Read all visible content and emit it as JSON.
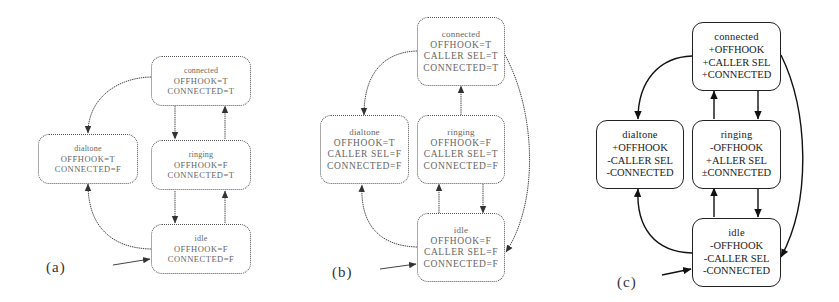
{
  "figure": {
    "panels": [
      {
        "label": "(a)",
        "style": "dotted",
        "states": {
          "connected": {
            "name": "connected",
            "vars": [
              "OFFHOOK=T",
              "CONNECTED=T"
            ]
          },
          "dialtone": {
            "name": "dialtone",
            "vars": [
              "OFFHOOK=T",
              "CONNECTED=F"
            ]
          },
          "ringing": {
            "name": "ringing",
            "vars": [
              "OFFHOOK=F",
              "CONNECTED=T"
            ]
          },
          "idle": {
            "name": "idle",
            "vars": [
              "OFFHOOK=F",
              "CONNECTED=F"
            ]
          }
        },
        "initial_state": "idle",
        "transitions": [
          [
            "connected",
            "dialtone"
          ],
          [
            "connected",
            "ringing"
          ],
          [
            "ringing",
            "connected"
          ],
          [
            "ringing",
            "idle"
          ],
          [
            "idle",
            "ringing"
          ],
          [
            "idle",
            "dialtone"
          ]
        ]
      },
      {
        "label": "(b)",
        "style": "dotted",
        "states": {
          "connected": {
            "name": "connected",
            "vars": [
              "OFFHOOK=T",
              "CALLER SEL=T",
              "CONNECTED=T"
            ]
          },
          "dialtone": {
            "name": "dialtone",
            "vars": [
              "OFFHOOK=T",
              "CALLER SEL=F",
              "CONNECTED=F"
            ]
          },
          "ringing": {
            "name": "ringing",
            "vars": [
              "OFFHOOK=F",
              "CALLER SEL=T",
              "CONNECTED=F"
            ]
          },
          "idle": {
            "name": "idle",
            "vars": [
              "OFFHOOK=F",
              "CALLER SEL=F",
              "CONNECTED=F"
            ]
          }
        },
        "initial_state": "idle",
        "transitions": [
          [
            "connected",
            "dialtone"
          ],
          [
            "ringing",
            "connected"
          ],
          [
            "connected",
            "idle"
          ],
          [
            "ringing",
            "idle"
          ],
          [
            "idle",
            "ringing"
          ],
          [
            "idle",
            "dialtone"
          ]
        ]
      },
      {
        "label": "(c)",
        "style": "solid",
        "states": {
          "connected": {
            "name": "connected",
            "vars": [
              "+OFFHOOK",
              "+CALLER SEL",
              "+CONNECTED"
            ]
          },
          "dialtone": {
            "name": "dialtone",
            "vars": [
              "+OFFHOOK",
              "-CALLER SEL",
              "-CONNECTED"
            ]
          },
          "ringing": {
            "name": "ringing",
            "vars": [
              "-OFFHOOK",
              "+ALLER SEL",
              "±CONNECTED"
            ]
          },
          "idle": {
            "name": "idle",
            "vars": [
              "-OFFHOOK",
              "-CALLER SEL",
              "-CONNECTED"
            ]
          }
        },
        "initial_state": "idle",
        "transitions": [
          [
            "connected",
            "dialtone"
          ],
          [
            "connected",
            "ringing"
          ],
          [
            "ringing",
            "connected"
          ],
          [
            "connected",
            "idle"
          ],
          [
            "ringing",
            "idle"
          ],
          [
            "idle",
            "ringing"
          ],
          [
            "idle",
            "dialtone"
          ]
        ]
      }
    ]
  }
}
